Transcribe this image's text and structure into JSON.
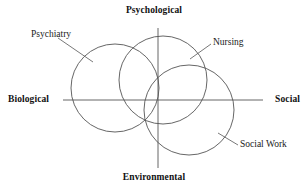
{
  "figure": {
    "type": "venn-diagram",
    "background_color": "#ffffff",
    "stroke_color": "#555555",
    "text_color": "#1a1a1a"
  },
  "axes": {
    "top": {
      "label": "Psychological"
    },
    "bottom": {
      "label": "Environmental"
    },
    "left": {
      "label": "Biological"
    },
    "right": {
      "label": "Social"
    }
  },
  "circles": [
    {
      "name": "psychiatry",
      "label": "Psychiatry",
      "cx": 115,
      "cy": 88,
      "r": 44
    },
    {
      "name": "nursing",
      "label": "Nursing",
      "cx": 163,
      "cy": 80,
      "r": 44
    },
    {
      "name": "social-work",
      "label": "Social Work",
      "cx": 189,
      "cy": 110,
      "r": 45
    }
  ],
  "leader_lines": [
    {
      "name": "psychiatry-leader",
      "from": [
        58,
        38
      ],
      "to": [
        93,
        62
      ]
    },
    {
      "name": "nursing-leader",
      "from": [
        211,
        44
      ],
      "to": [
        190,
        59
      ]
    },
    {
      "name": "social-work-leader",
      "from": [
        238,
        145
      ],
      "to": [
        218,
        133
      ]
    }
  ]
}
